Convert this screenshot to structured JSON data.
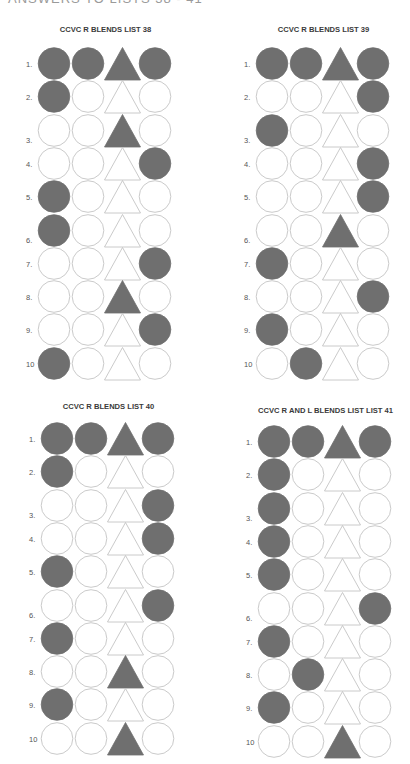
{
  "page": {
    "header": "ANSWERS TO LISTS 38 - 41"
  },
  "colors": {
    "filled": "#6f6f6f",
    "outline": "#bdbdbd",
    "empty": "#ffffff"
  },
  "shape_order": [
    "circle",
    "circle",
    "triangle",
    "circle"
  ],
  "panels": [
    {
      "id": "list-38",
      "title": "CCVC R BLENDS LIST 38",
      "left": 0,
      "title_top": 25,
      "grid_top": 47,
      "grid_left": 38,
      "rows": [
        {
          "label": "1.",
          "filled": [
            1,
            2,
            3,
            4
          ]
        },
        {
          "label": "2.",
          "filled": [
            1
          ]
        },
        {
          "label": "3.",
          "filled": [
            3
          ]
        },
        {
          "label": "4.",
          "filled": [
            4
          ]
        },
        {
          "label": "5.",
          "filled": [
            1
          ]
        },
        {
          "label": "6.",
          "filled": [
            1
          ]
        },
        {
          "label": "7.",
          "filled": [
            4
          ]
        },
        {
          "label": "8.",
          "filled": [
            3
          ]
        },
        {
          "label": "9.",
          "filled": [
            4
          ]
        },
        {
          "label": "10",
          "filled": [
            1
          ]
        }
      ]
    },
    {
      "id": "list-39",
      "title": "CCVC R BLENDS LIST 39",
      "left": 218,
      "title_top": 25,
      "grid_top": 47,
      "grid_left": 38,
      "rows": [
        {
          "label": "1.",
          "filled": [
            1,
            2,
            3,
            4
          ]
        },
        {
          "label": "2.",
          "filled": [
            4
          ]
        },
        {
          "label": "3.",
          "filled": [
            1
          ]
        },
        {
          "label": "4.",
          "filled": [
            4
          ]
        },
        {
          "label": "5.",
          "filled": [
            4
          ]
        },
        {
          "label": "6.",
          "filled": [
            3
          ]
        },
        {
          "label": "7.",
          "filled": [
            1
          ]
        },
        {
          "label": "8.",
          "filled": [
            4
          ]
        },
        {
          "label": "9.",
          "filled": [
            1
          ]
        },
        {
          "label": "10",
          "filled": [
            2
          ]
        }
      ]
    },
    {
      "id": "list-40",
      "title": "CCVC R BLENDS LIST 40",
      "left": 3,
      "title_top": 402,
      "grid_top": 422,
      "grid_left": 38,
      "rows": [
        {
          "label": "1.",
          "filled": [
            1,
            2,
            3,
            4
          ]
        },
        {
          "label": "2.",
          "filled": [
            1
          ]
        },
        {
          "label": "3.",
          "filled": [
            4
          ]
        },
        {
          "label": "4.",
          "filled": [
            4
          ]
        },
        {
          "label": "5.",
          "filled": [
            1
          ]
        },
        {
          "label": "6.",
          "filled": [
            4
          ]
        },
        {
          "label": "7.",
          "filled": [
            1
          ]
        },
        {
          "label": "8.",
          "filled": [
            3
          ]
        },
        {
          "label": "9.",
          "filled": [
            1
          ]
        },
        {
          "label": "10",
          "filled": [
            3
          ]
        }
      ]
    },
    {
      "id": "list-41",
      "title": "CCVC R AND L BLENDS LIST LIST  41",
      "left": 220,
      "title_top": 406,
      "grid_top": 425,
      "grid_left": 38,
      "rows": [
        {
          "label": "1.",
          "filled": [
            1,
            2,
            3,
            4
          ]
        },
        {
          "label": "2.",
          "filled": [
            1
          ]
        },
        {
          "label": "3.",
          "filled": [
            1
          ]
        },
        {
          "label": "4.",
          "filled": [
            1
          ]
        },
        {
          "label": "5.",
          "filled": [
            1
          ]
        },
        {
          "label": "6.",
          "filled": [
            4
          ]
        },
        {
          "label": "7.",
          "filled": [
            1
          ]
        },
        {
          "label": "8.",
          "filled": [
            2
          ]
        },
        {
          "label": "9.",
          "filled": [
            1
          ]
        },
        {
          "label": "10",
          "filled": [
            3
          ]
        }
      ]
    }
  ]
}
